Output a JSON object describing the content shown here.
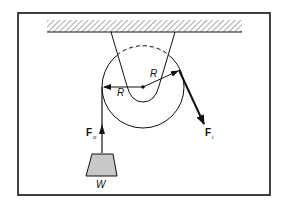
{
  "figure": {
    "type": "pulley-free-body-diagram",
    "labels": {
      "radius_left": "R",
      "radius_right": "R",
      "force_out": "F",
      "force_out_sub": "o",
      "force_in": "F",
      "force_in_sub": "i",
      "weight": "W"
    },
    "colors": {
      "line": "#111111",
      "weight_fill": "#c8c8c8",
      "background": "#ffffff"
    }
  }
}
